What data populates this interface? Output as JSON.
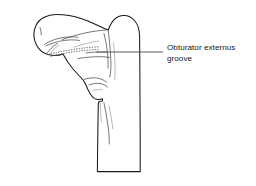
{
  "figure": {
    "kind": "anatomical-line-drawing",
    "background_color": "#ffffff",
    "outline_color": "#1a1a1a",
    "detail_color": "#4a4a4a",
    "leader_color": "#5a5a5a",
    "text_color": "#161616"
  },
  "annotations": [
    {
      "id": "obturator-externus-groove",
      "label": "Obturator externus\ngroove",
      "label_line_1": "Obturator externus",
      "label_line_2": "groove",
      "leader": {
        "from_x": 163,
        "from_y": 52,
        "to_x": 96,
        "to_y": 52
      }
    }
  ],
  "structures": {
    "femoral_head": "head of femur",
    "femoral_neck": "neck of femur",
    "greater_trochanter": "greater trochanter",
    "lesser_trochanter": "lesser trochanter",
    "intertrochanteric_crest": "intertrochanteric crest",
    "shaft": "femoral shaft",
    "groove": "obturator externus groove"
  }
}
